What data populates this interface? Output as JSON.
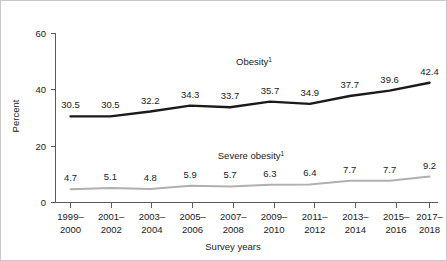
{
  "chart_data": {
    "type": "line",
    "title": "",
    "xlabel": "Survey years",
    "ylabel": "Percent",
    "ylim": [
      0,
      60
    ],
    "yticks": [
      0,
      20,
      40,
      60
    ],
    "ytick_labels": [
      "0",
      "20",
      "40",
      "60"
    ],
    "grid": false,
    "legend": "inline-series-labels",
    "categories": [
      "1999–\n2000",
      "2001–\n2002",
      "2003–\n2004",
      "2005–\n2006",
      "2007–\n2008",
      "2009–\n2010",
      "2011–\n2012",
      "2013–\n2014",
      "2015–\n2016",
      "2017–\n2018"
    ],
    "categories_line1": [
      "1999–",
      "2001–",
      "2003–",
      "2005–",
      "2007–",
      "2009–",
      "2011–",
      "2013–",
      "2015–",
      "2017–"
    ],
    "categories_line2": [
      "2000",
      "2002",
      "2004",
      "2006",
      "2008",
      "2010",
      "2012",
      "2014",
      "2016",
      "2018"
    ],
    "series": [
      {
        "name": "Obesity",
        "name_superscript": "1",
        "label_text": "Obesity",
        "color": "#1a1a1a",
        "line_width": 2.4,
        "values": [
          30.5,
          30.5,
          32.2,
          34.3,
          33.7,
          35.7,
          34.9,
          37.7,
          39.6,
          42.4
        ],
        "value_labels": [
          "30.5",
          "30.5",
          "32.2",
          "34.3",
          "33.7",
          "35.7",
          "34.9",
          "37.7",
          "39.6",
          "42.4"
        ]
      },
      {
        "name": "Severe obesity",
        "name_superscript": "1",
        "label_text": "Severe obesity",
        "color": "#b0b0b0",
        "line_width": 2.0,
        "values": [
          4.7,
          5.1,
          4.8,
          5.9,
          5.7,
          6.3,
          6.4,
          7.7,
          7.7,
          9.2
        ],
        "value_labels": [
          "4.7",
          "5.1",
          "4.8",
          "5.9",
          "5.7",
          "6.3",
          "6.4",
          "7.7",
          "7.7",
          "9.2"
        ]
      }
    ]
  },
  "axes": {
    "y_title": "Percent",
    "x_title": "Survey years"
  },
  "colors": {
    "obesity_line": "#1a1a1a",
    "severe_obesity_line": "#b0b0b0",
    "axis": "#5a5a5a",
    "text": "#1a1a1a",
    "frame": "#c8c8c8",
    "background": "#ffffff"
  }
}
